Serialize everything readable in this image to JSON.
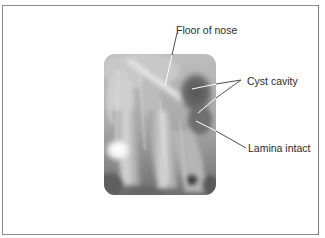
{
  "figure": {
    "image": {
      "subject": "dental-radiograph",
      "description": "Periapical X-ray of maxillary teeth showing a radicular cyst"
    },
    "labels": [
      {
        "id": "floor_of_nose",
        "text": "Floor of nose"
      },
      {
        "id": "cyst_cavity",
        "text": "Cyst cavity"
      },
      {
        "id": "lamina_intact",
        "text": "Lamina intact"
      }
    ],
    "colors": {
      "frame": "#8a8a8a",
      "leader_line": "#ffffff",
      "leader_line_outside": "#3a3a3a",
      "text": "#2a2a2a"
    }
  }
}
